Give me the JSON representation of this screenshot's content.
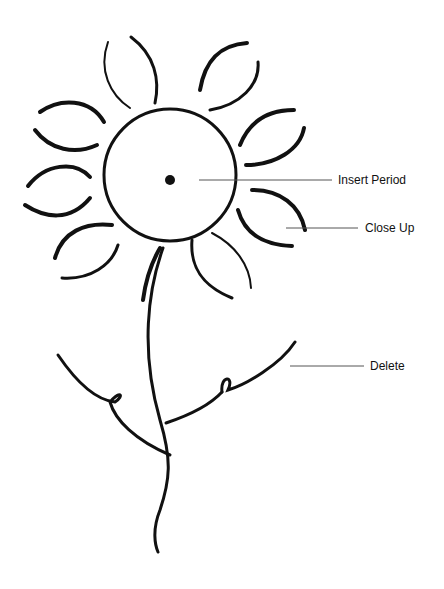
{
  "diagram": {
    "labels": [
      {
        "id": "insert-period",
        "text": "Insert Period",
        "x": 338,
        "y": 174
      },
      {
        "id": "close-up",
        "text": "Close Up",
        "x": 365,
        "y": 222
      },
      {
        "id": "delete",
        "text": "Delete",
        "x": 370,
        "y": 360
      }
    ],
    "colors": {
      "ink": "#111111",
      "leader": "#555555",
      "background": "#ffffff"
    }
  }
}
